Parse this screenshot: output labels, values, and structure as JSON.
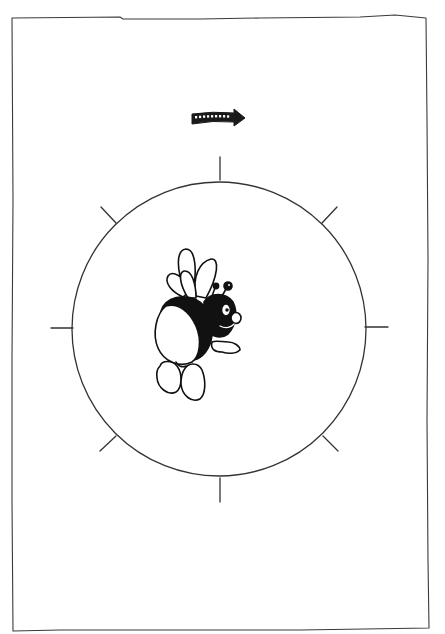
{
  "figure": {
    "frame": {
      "x": 12,
      "y": 16,
      "width": 416,
      "height": 614,
      "stroke": "#333333"
    },
    "arrow": {
      "direction": "clockwise-right",
      "cx": 218,
      "cy": 118,
      "color": "#1a1a1a"
    },
    "dial": {
      "center": [
        219,
        329
      ],
      "radius": 147,
      "stroke": "#333333",
      "ticks": [
        {
          "label": "top",
          "x1": 220,
          "y1": 157,
          "x2": 220,
          "y2": 180
        },
        {
          "label": "top-right",
          "x1": 322,
          "y1": 223,
          "x2": 337,
          "y2": 207
        },
        {
          "label": "right",
          "x1": 365,
          "y1": 327,
          "x2": 388,
          "y2": 327
        },
        {
          "label": "bottom-right",
          "x1": 323,
          "y1": 436,
          "x2": 338,
          "y2": 451
        },
        {
          "label": "bottom",
          "x1": 220,
          "y1": 478,
          "x2": 220,
          "y2": 502
        },
        {
          "label": "bottom-left",
          "x1": 116,
          "y1": 436,
          "x2": 100,
          "y2": 451
        },
        {
          "label": "left",
          "x1": 51,
          "y1": 328,
          "x2": 73,
          "y2": 328
        },
        {
          "label": "top-left",
          "x1": 101,
          "y1": 207,
          "x2": 116,
          "y2": 223
        }
      ]
    },
    "character": {
      "name": "bee",
      "facing": "right",
      "center": [
        198,
        325
      ]
    }
  }
}
